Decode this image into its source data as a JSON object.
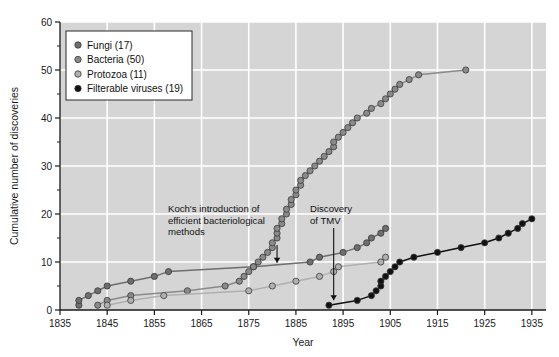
{
  "chart_data": {
    "type": "line",
    "title": "",
    "xlabel": "Year",
    "ylabel": "Cumulative number of discoveries",
    "xlim": [
      1835,
      1938
    ],
    "ylim": [
      0,
      60
    ],
    "xticks": [
      1835,
      1845,
      1855,
      1865,
      1875,
      1885,
      1895,
      1905,
      1915,
      1925,
      1935
    ],
    "yticks": [
      0,
      10,
      20,
      30,
      40,
      50,
      60
    ],
    "yminorticks": [
      5,
      15,
      25,
      35,
      45,
      55
    ],
    "grid": true,
    "grid_color": "#ffffff",
    "plot_background": "#d5d5d5",
    "legend_position": "upper-left",
    "series": [
      {
        "name": "Fungi (17)",
        "label": "Fungi",
        "count": 17,
        "color": "#6e6e6e",
        "points": [
          [
            1839,
            1
          ],
          [
            1839,
            2
          ],
          [
            1841,
            3
          ],
          [
            1843,
            4
          ],
          [
            1845,
            5
          ],
          [
            1850,
            6
          ],
          [
            1855,
            7
          ],
          [
            1858,
            8
          ],
          [
            1876,
            9
          ],
          [
            1888,
            10
          ],
          [
            1890,
            11
          ],
          [
            1895,
            12
          ],
          [
            1898,
            13
          ],
          [
            1900,
            14
          ],
          [
            1901,
            15
          ],
          [
            1903,
            16
          ],
          [
            1904,
            17
          ]
        ]
      },
      {
        "name": "Bacteria (50)",
        "label": "Bacteria",
        "count": 50,
        "color": "#8a8a8a",
        "points": [
          [
            1843,
            1
          ],
          [
            1845,
            2
          ],
          [
            1850,
            3
          ],
          [
            1862,
            4
          ],
          [
            1870,
            5
          ],
          [
            1873,
            6
          ],
          [
            1874,
            7
          ],
          [
            1875,
            8
          ],
          [
            1876,
            9
          ],
          [
            1877,
            10
          ],
          [
            1878,
            11
          ],
          [
            1879,
            12
          ],
          [
            1880,
            13
          ],
          [
            1880,
            14
          ],
          [
            1881,
            15
          ],
          [
            1881,
            16
          ],
          [
            1881,
            17
          ],
          [
            1882,
            18
          ],
          [
            1882,
            19
          ],
          [
            1883,
            20
          ],
          [
            1883,
            21
          ],
          [
            1884,
            22
          ],
          [
            1884,
            23
          ],
          [
            1885,
            24
          ],
          [
            1885,
            25
          ],
          [
            1886,
            26
          ],
          [
            1886,
            27
          ],
          [
            1887,
            28
          ],
          [
            1888,
            29
          ],
          [
            1889,
            30
          ],
          [
            1890,
            31
          ],
          [
            1891,
            32
          ],
          [
            1892,
            33
          ],
          [
            1893,
            34
          ],
          [
            1893,
            35
          ],
          [
            1894,
            36
          ],
          [
            1895,
            37
          ],
          [
            1896,
            38
          ],
          [
            1897,
            39
          ],
          [
            1898,
            40
          ],
          [
            1900,
            41
          ],
          [
            1901,
            42
          ],
          [
            1903,
            43
          ],
          [
            1904,
            44
          ],
          [
            1905,
            45
          ],
          [
            1906,
            46
          ],
          [
            1907,
            47
          ],
          [
            1909,
            48
          ],
          [
            1911,
            49
          ],
          [
            1921,
            50
          ]
        ]
      },
      {
        "name": "Protozoa (11)",
        "label": "Protozoa",
        "count": 11,
        "color": "#b0b0b0",
        "points": [
          [
            1845,
            1
          ],
          [
            1850,
            2
          ],
          [
            1857,
            3
          ],
          [
            1875,
            4
          ],
          [
            1880,
            5
          ],
          [
            1885,
            6
          ],
          [
            1890,
            7
          ],
          [
            1893,
            8
          ],
          [
            1894,
            9
          ],
          [
            1903,
            10
          ],
          [
            1904,
            11
          ]
        ]
      },
      {
        "name": "Filterable viruses (19)",
        "label": "Filterable viruses",
        "count": 19,
        "color": "#111111",
        "points": [
          [
            1892,
            1
          ],
          [
            1898,
            2
          ],
          [
            1901,
            3
          ],
          [
            1902,
            4
          ],
          [
            1903,
            5
          ],
          [
            1903,
            6
          ],
          [
            1904,
            7
          ],
          [
            1905,
            8
          ],
          [
            1906,
            9
          ],
          [
            1907,
            10
          ],
          [
            1910,
            11
          ],
          [
            1915,
            12
          ],
          [
            1920,
            13
          ],
          [
            1925,
            14
          ],
          [
            1928,
            15
          ],
          [
            1930,
            16
          ],
          [
            1932,
            17
          ],
          [
            1933,
            18
          ],
          [
            1935,
            19
          ]
        ]
      }
    ],
    "annotations": [
      {
        "id": "koch",
        "text": [
          "Koch's introduction of",
          "efficient bacteriological",
          "methods"
        ],
        "target_x": 1881,
        "target_y": 9
      },
      {
        "id": "tmv",
        "text": [
          "Discovery",
          "of TMV"
        ],
        "target_x": 1893,
        "target_y": 1
      }
    ]
  }
}
